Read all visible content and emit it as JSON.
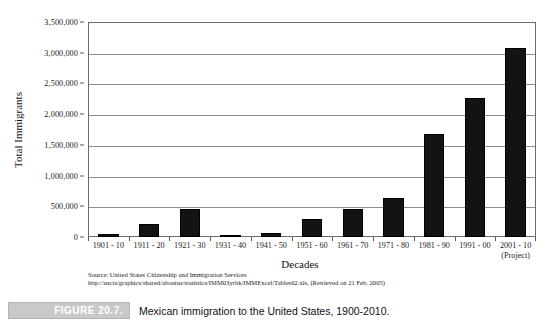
{
  "chart_data": {
    "type": "bar",
    "title": "",
    "xlabel": "Decades",
    "ylabel": "Total Immigrants",
    "ylim": [
      0,
      3500000
    ],
    "grid": true,
    "legend": "none",
    "categories": [
      "1901 - 10",
      "1911 - 20",
      "1921 - 30",
      "1931 - 40",
      "1941 - 50",
      "1951 - 60",
      "1961 - 70",
      "1971 - 80",
      "1981 - 90",
      "1991 - 00",
      "2001 - 10"
    ],
    "category_sublabels": [
      "",
      "",
      "",
      "",
      "",
      "",
      "",
      "",
      "",
      "",
      "(Project)"
    ],
    "values": [
      50000,
      220000,
      460000,
      22000,
      60000,
      300000,
      455000,
      640000,
      1677000,
      2262000,
      3080000
    ],
    "ytick_labels": [
      "0",
      "500,000",
      "1,000,000",
      "1,500,000",
      "2,000,000",
      "2,500,000",
      "3,000,000",
      "3,500,000"
    ],
    "ytick_values": [
      0,
      500000,
      1000000,
      1500000,
      2000000,
      2500000,
      3000000,
      3500000
    ],
    "bar_color": "#131313",
    "grid_color": "#8d8d8d",
    "frame_color": "#6b6b6b"
  },
  "source": {
    "line1": "Source: United States Citizenship and Immigration Services",
    "line2": "http://uscis/graphics/shared/aboutus/statistics/IMM03yrbk/IMMExcel/Tables02.xls, (Retrieved on 21 Feb. 2005)"
  },
  "caption": {
    "figure_label": "FIGURE 20.7.",
    "text": "Mexican immigration to the United States, 1900-2010.",
    "box_color": "#c9c9c9",
    "label_text_color": "#ffffff"
  }
}
